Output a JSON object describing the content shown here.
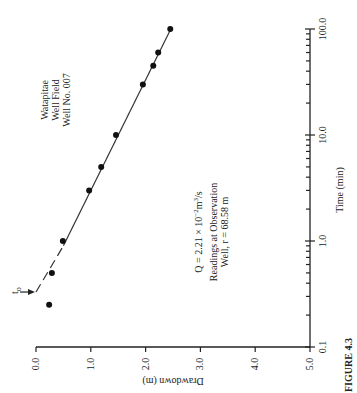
{
  "chart_data": {
    "type": "scatter",
    "orientation": "rotated 90 degrees counter-clockwise",
    "title": "Watapitae Well Field Well No. 007",
    "xlabel": "Drawdown (m)",
    "ylabel": "Time (min)",
    "x_scale": "linear",
    "y_scale": "log",
    "xlim": [
      0.0,
      5.0
    ],
    "ylim": [
      0.1,
      100.0
    ],
    "x_ticks": [
      "0.0",
      "1.0",
      "2.0",
      "3.0",
      "4.0",
      "5.0"
    ],
    "x_tick_values": [
      0,
      1,
      2,
      3,
      4,
      5
    ],
    "y_ticks": [
      "0.1",
      "1.0",
      "10.0",
      "100.0"
    ],
    "y_tick_values": [
      0.1,
      1,
      10,
      100
    ],
    "grid": false,
    "series": [
      {
        "name": "Observation well readings",
        "points": [
          {
            "t": 0.25,
            "s": 0.24
          },
          {
            "t": 0.5,
            "s": 0.29
          },
          {
            "t": 1.0,
            "s": 0.49
          },
          {
            "t": 3.0,
            "s": 0.97
          },
          {
            "t": 5.0,
            "s": 1.19
          },
          {
            "t": 10.0,
            "s": 1.46
          },
          {
            "t": 30.0,
            "s": 1.95
          },
          {
            "t": 45.0,
            "s": 2.14
          },
          {
            "t": 60.0,
            "s": 2.23
          },
          {
            "t": 100.0,
            "s": 2.45
          }
        ]
      }
    ],
    "fit_line": {
      "solid": [
        {
          "t": 0.9,
          "s": 0.5
        },
        {
          "t": 100.0,
          "s": 2.46
        }
      ],
      "dashed": [
        {
          "t": 0.33,
          "s": 0.0
        },
        {
          "t": 0.9,
          "s": 0.5
        }
      ]
    },
    "t0_marker": {
      "label": "t",
      "subscript": "o",
      "t": 0.33
    },
    "annotations": {
      "title_lines": [
        "Watapitae",
        "Well Field",
        "Well No. 007"
      ],
      "q_prefix": "Q = 2.21 × 10",
      "q_exp": "−2",
      "q_unit": "m",
      "q_unit_exp": "3",
      "q_suffix": "/s",
      "readings_lines": [
        "Readings at Observation",
        "Well, r = 68.58 m"
      ]
    },
    "caption_fragment": "FIGURE 4.3"
  }
}
